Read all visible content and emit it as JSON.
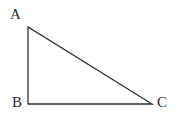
{
  "figure": {
    "kind": "geometry-diagram",
    "shape_name": "right-triangle",
    "background_color": "#ffffff",
    "stroke_color": "#2f2f2f",
    "stroke_width": 1.3,
    "label_color": "#2b2b2b",
    "width": 182,
    "height": 121
  },
  "vertices": [
    {
      "id": "A",
      "label": "A",
      "x": 28,
      "y": 27,
      "label_x": 10,
      "label_y": 7
    },
    {
      "id": "B",
      "label": "B",
      "x": 28,
      "y": 104,
      "label_x": 12,
      "label_y": 95
    },
    {
      "id": "C",
      "label": "C",
      "x": 152,
      "y": 104,
      "label_x": 157,
      "label_y": 95
    }
  ],
  "edges": [
    {
      "id": "AB",
      "from": "A",
      "to": "B",
      "role": "vertical-leg"
    },
    {
      "id": "BC",
      "from": "B",
      "to": "C",
      "role": "horizontal-leg"
    },
    {
      "id": "CA",
      "from": "C",
      "to": "A",
      "role": "hypotenuse"
    }
  ],
  "polygon_points": "28,27 28,104 152,104",
  "right_angle_at": "B"
}
